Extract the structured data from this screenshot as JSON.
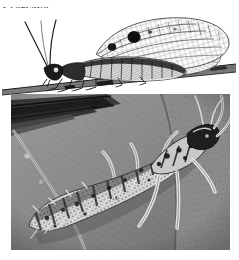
{
  "figure": {
    "heading": "Lacewing",
    "panels": [
      {
        "id": "adult-illustration",
        "kind": "engraving",
        "subject": "adult lacewing perched on a diagonal twig",
        "palette": {
          "ink": "#141414",
          "paper": "#ffffff",
          "wash": "#9a9a9a"
        },
        "features": [
          "two long curving antennae",
          "lacy net-veined forewing and hindwing",
          "dark spots on the leading wing area",
          "six slender legs gripping the twig",
          "horizontal twig running lower-left to upper-right"
        ]
      },
      {
        "id": "larva-photograph",
        "kind": "black-and-white photograph",
        "subject": "lacewing larva (aphid lion) walking on tree bark",
        "palette": {
          "dark": "#2a2a2a",
          "mid": "#8a8a8a",
          "light": "#e3e3e3"
        },
        "features": [
          "segmented bristly abdomen",
          "large curved sickle mandibles",
          "pale mottled body with dark banding",
          "bark substrate with cracked texture",
          "dark bark ridge across the upper-left corner"
        ]
      }
    ]
  }
}
